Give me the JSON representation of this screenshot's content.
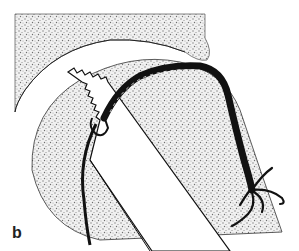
{
  "figure": {
    "panel_label": "b",
    "colors": {
      "background": "#ffffff",
      "stipple": "#8a8a8a",
      "ink": "#111111"
    },
    "regions": [
      {
        "name": "upper-bone-region",
        "style": "stippled"
      },
      {
        "name": "joint-space",
        "style": "white-gap"
      },
      {
        "name": "rounded-head",
        "style": "stippled"
      },
      {
        "name": "instrument-shaft",
        "style": "white-band-serrated-tip"
      },
      {
        "name": "suture-cord",
        "style": "thick-black-strand-frayed-end"
      },
      {
        "name": "thin-guide-line",
        "style": "black-line"
      }
    ]
  }
}
